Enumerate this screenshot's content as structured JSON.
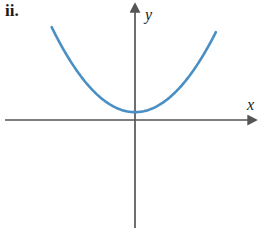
{
  "figure": {
    "part_label": "ii.",
    "x_axis_label": "x",
    "y_axis_label": "y",
    "curve_color": "#4a8fc4",
    "axis_color": "#555555",
    "text_color": "#1a1a1a",
    "background_color": "#ffffff"
  },
  "chart_data": {
    "type": "line",
    "title": "",
    "subtitle": "",
    "xlabel": "x",
    "ylabel": "y",
    "grid": false,
    "legend": null,
    "annotations": [
      "ii."
    ],
    "xlim": [
      -5,
      5
    ],
    "ylim": [
      -3.2,
      5.2
    ],
    "origin_px": [
      135,
      120
    ],
    "px_per_unit": [
      24.5,
      24.5
    ],
    "series": [
      {
        "name": "parabola",
        "equation": "y = 0.3 x^2 + 0.32",
        "color": "#4a8fc4",
        "linewidth": 2.6,
        "x": [
          -3.4,
          -3.0,
          -2.6,
          -2.2,
          -1.8,
          -1.4,
          -1.0,
          -0.6,
          -0.2,
          0.0,
          0.2,
          0.6,
          1.0,
          1.4,
          1.8,
          2.2,
          2.6,
          3.0,
          3.3
        ],
        "y": [
          4.79,
          3.02,
          2.35,
          1.77,
          1.29,
          0.91,
          0.62,
          0.43,
          0.33,
          0.32,
          0.33,
          0.43,
          0.62,
          0.91,
          1.29,
          1.77,
          2.35,
          3.02,
          4.59
        ]
      }
    ],
    "vertex": {
      "x": 0.0,
      "y": 0.32
    },
    "axes": {
      "x_axis": {
        "from_px": [
          5,
          120
        ],
        "to_px": [
          255,
          120
        ],
        "arrow_at": "right"
      },
      "y_axis": {
        "from_px": [
          135,
          228
        ],
        "to_px": [
          135,
          5
        ],
        "arrow_at": "top"
      }
    }
  }
}
